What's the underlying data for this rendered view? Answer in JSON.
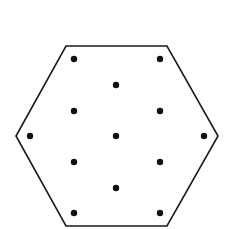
{
  "diagram": {
    "background": "#ffffff",
    "stroke_color": "#1a1a1a",
    "dot_color": "#111111",
    "hexagon": {
      "points": [
        [
          66,
          46
        ],
        [
          167,
          46
        ],
        [
          218,
          136
        ],
        [
          167,
          226
        ],
        [
          66,
          226
        ],
        [
          16,
          136
        ]
      ],
      "stroke_width": 1.6
    },
    "dot_radius": 3.2,
    "dots": [
      [
        74,
        59
      ],
      [
        160,
        59
      ],
      [
        116,
        85
      ],
      [
        74,
        111
      ],
      [
        160,
        111
      ],
      [
        30,
        136
      ],
      [
        116,
        136
      ],
      [
        204,
        136
      ],
      [
        74,
        162
      ],
      [
        160,
        162
      ],
      [
        116,
        188
      ],
      [
        74,
        213
      ],
      [
        160,
        213
      ]
    ]
  }
}
